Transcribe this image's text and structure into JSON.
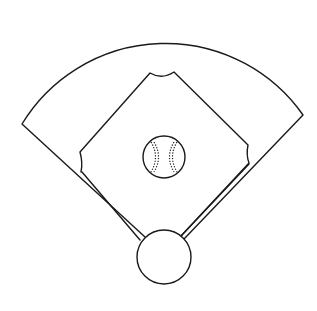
{
  "illustration": {
    "subject": "baseball field",
    "elements": [
      "outfield",
      "infield diamond",
      "baseball",
      "home plate circle",
      "foul lines"
    ],
    "colors": {
      "line": "#1a1a1a",
      "background": "#ffffff"
    }
  }
}
